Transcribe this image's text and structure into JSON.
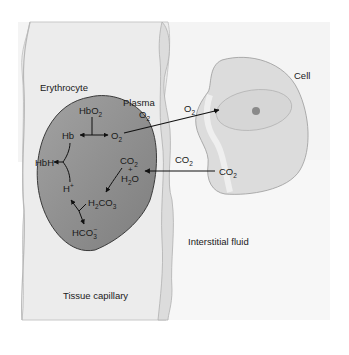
{
  "figure": {
    "type": "physiology-diagram",
    "regions": {
      "capillary": "Tissue capillary",
      "erythrocyte": "Erythrocyte",
      "plasma": "Plasma",
      "cell": "Cell",
      "interstitial": "Interstitial fluid"
    },
    "species": {
      "hbo2": "HbO",
      "hbo2_sub": "2",
      "hb": "Hb",
      "o2_rbc": "O",
      "o2_rbc_sub": "2",
      "o2_plasma": "O",
      "o2_plasma_sub": "2",
      "o2_cell": "O",
      "o2_cell_sub": "2",
      "hbh": "HbH",
      "h_plus": "H",
      "h_plus_sup": "+",
      "co2_rbc": "CO",
      "co2_rbc_sub": "2",
      "plus": "+",
      "h2o": "H",
      "h2o_sub": "2",
      "h2o_o": "O",
      "h2co3_h": "H",
      "h2co3_sub1": "2",
      "h2co3_co": "CO",
      "h2co3_sub2": "3",
      "hco3": "HCO",
      "hco3_sub": "3",
      "hco3_sup": "−",
      "co2_interstitial": "CO",
      "co2_interstitial_sub": "2",
      "co2_cell": "CO",
      "co2_cell_sub": "2"
    },
    "colors": {
      "capillary_fill": "#ececec",
      "capillary_wall": "#d8d8d8",
      "erythrocyte_fill": "#8f8f8f",
      "erythrocyte_stroke": "#3a3a3a",
      "cell_fill": "#dcdcdc",
      "cell_stroke": "#9a9a9a",
      "nucleolus": "#8a8a8a",
      "background": "#f6f6f6"
    },
    "flows": [
      {
        "from": "HbO2",
        "to": "Hb + O2",
        "direction": "dissociation"
      },
      {
        "from": "O2 (erythrocyte)",
        "to": "Cell",
        "via": "Plasma"
      },
      {
        "from": "Cell CO2",
        "to": "Erythrocyte CO2"
      },
      {
        "from": "CO2 + H2O",
        "to": "H2CO3"
      },
      {
        "from": "H2CO3",
        "to": "H+ + HCO3-"
      },
      {
        "from": "Hb + H+",
        "to": "HbH"
      }
    ]
  }
}
